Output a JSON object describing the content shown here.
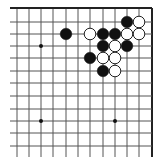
{
  "board": {
    "description": "Go board fragment, top-right corner view",
    "colors": {
      "background": "#ffffff",
      "line": "#555555",
      "edge": "#222222",
      "black_stone": "#111111",
      "white_stone": "#ffffff",
      "white_stone_outline": "#222222",
      "star_point": "#111111"
    },
    "columns_x": [
      17,
      29,
      41,
      53,
      66,
      78,
      90,
      103,
      115,
      127,
      139,
      152
    ],
    "rows_y": [
      8,
      22,
      34,
      46,
      58,
      71,
      83,
      96,
      109,
      121,
      133,
      146
    ],
    "edges": [
      "top",
      "right"
    ],
    "star_points": [
      {
        "col": 2,
        "row": 3
      },
      {
        "col": 2,
        "row": 9
      },
      {
        "col": 8,
        "row": 9
      }
    ],
    "stones": [
      {
        "color": "black",
        "col": 9,
        "row": 1
      },
      {
        "color": "white",
        "col": 10,
        "row": 1
      },
      {
        "color": "black",
        "col": 4,
        "row": 2
      },
      {
        "color": "white",
        "col": 6,
        "row": 2
      },
      {
        "color": "black",
        "col": 7,
        "row": 2
      },
      {
        "color": "black",
        "col": 8,
        "row": 2
      },
      {
        "color": "white",
        "col": 9,
        "row": 2
      },
      {
        "color": "white",
        "col": 10,
        "row": 2
      },
      {
        "color": "black",
        "col": 7,
        "row": 3
      },
      {
        "color": "white",
        "col": 8,
        "row": 3
      },
      {
        "color": "black",
        "col": 9,
        "row": 3
      },
      {
        "color": "black",
        "col": 6,
        "row": 4
      },
      {
        "color": "white",
        "col": 7,
        "row": 4
      },
      {
        "color": "white",
        "col": 8,
        "row": 4
      },
      {
        "color": "black",
        "col": 7,
        "row": 5
      },
      {
        "color": "white",
        "col": 8,
        "row": 5
      }
    ]
  }
}
